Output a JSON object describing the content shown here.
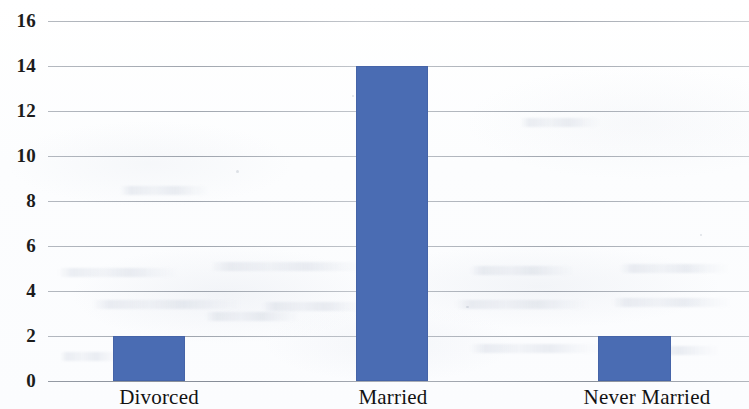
{
  "chart_data": {
    "type": "bar",
    "title": "",
    "subtitle": "",
    "xlabel": "",
    "ylabel": "",
    "categories": [
      "Divorced",
      "Married",
      "Never Married"
    ],
    "values": [
      2,
      14,
      2
    ],
    "series": [
      {
        "name": "Count",
        "values": [
          2,
          14,
          2
        ]
      }
    ],
    "ylim": [
      0,
      16
    ],
    "y_ticks": [
      16,
      14,
      12,
      10,
      8,
      6,
      4,
      2,
      0
    ],
    "y_tick_labels": [
      "16",
      "14",
      "12",
      "10",
      "8",
      "6",
      "4",
      "2",
      "0"
    ],
    "grid": true,
    "grid_axis": "y",
    "legend": false,
    "legend_position": "none",
    "bar_color": "#4a6cb3",
    "gridline_color": "#78808c",
    "background_color": "#fdfdfd"
  }
}
